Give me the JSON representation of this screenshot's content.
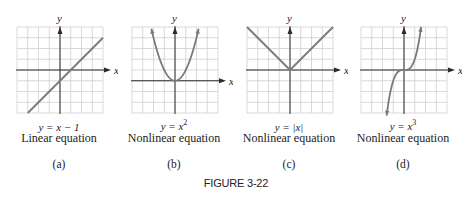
{
  "figure": {
    "caption": "FIGURE 3-22"
  },
  "colors": {
    "grid": "#cfcfcf",
    "axis": "#2a2a2a",
    "curve": "#7a7a7a",
    "text": "#222222"
  },
  "panels": [
    {
      "letter": "(a)",
      "equation_prefix": "y = ",
      "equation_body": "x − 1",
      "equation_sup": "",
      "description": "Linear equation",
      "x_label": "x",
      "y_label": "y"
    },
    {
      "letter": "(b)",
      "equation_prefix": "y = ",
      "equation_body": "x",
      "equation_sup": "2",
      "description": "Nonlinear equation",
      "x_label": "x",
      "y_label": "y"
    },
    {
      "letter": "(c)",
      "equation_prefix": "y = ",
      "equation_body": "|x|",
      "equation_sup": "",
      "description": "Nonlinear equation",
      "x_label": "x",
      "y_label": "y"
    },
    {
      "letter": "(d)",
      "equation_prefix": "y = ",
      "equation_body": "x",
      "equation_sup": "3",
      "description": "Nonlinear equation",
      "x_label": "x",
      "y_label": "y"
    }
  ],
  "chart_data": [
    {
      "type": "line",
      "title": "y = x − 1",
      "subtitle": "Linear equation",
      "label": "(a)",
      "xlabel": "x",
      "ylabel": "y",
      "grid": true,
      "grid_cells": [
        8,
        8
      ],
      "xlim": [
        -4,
        4
      ],
      "ylim": [
        -4,
        4
      ],
      "x": [
        -3,
        -2,
        -1,
        0,
        1,
        2,
        3,
        4
      ],
      "y": [
        -4,
        -3,
        -2,
        -1,
        0,
        1,
        2,
        3
      ]
    },
    {
      "type": "line",
      "title": "y = x^2",
      "subtitle": "Nonlinear equation",
      "label": "(b)",
      "xlabel": "x",
      "ylabel": "y",
      "grid": true,
      "grid_cells": [
        8,
        8
      ],
      "xlim": [
        -4,
        4
      ],
      "ylim": [
        -3,
        5
      ],
      "x": [
        -2.2,
        -2,
        -1.5,
        -1,
        -0.5,
        0,
        0.5,
        1,
        1.5,
        2,
        2.2
      ],
      "y": [
        4.84,
        4,
        2.25,
        1,
        0.25,
        0,
        0.25,
        1,
        2.25,
        4,
        4.84
      ]
    },
    {
      "type": "line",
      "title": "y = |x|",
      "subtitle": "Nonlinear equation",
      "label": "(c)",
      "xlabel": "x",
      "ylabel": "y",
      "grid": true,
      "grid_cells": [
        8,
        8
      ],
      "xlim": [
        -4,
        4
      ],
      "ylim": [
        -4,
        4
      ],
      "x": [
        -4,
        -2,
        0,
        2,
        4
      ],
      "y": [
        4,
        2,
        0,
        2,
        4
      ]
    },
    {
      "type": "line",
      "title": "y = x^3",
      "subtitle": "Nonlinear equation",
      "label": "(d)",
      "xlabel": "x",
      "ylabel": "y",
      "grid": true,
      "grid_cells": [
        8,
        8
      ],
      "xlim": [
        -4,
        4
      ],
      "ylim": [
        -4,
        4
      ],
      "x": [
        -1.6,
        -1.4,
        -1.2,
        -1,
        -0.5,
        0,
        0.5,
        1,
        1.2,
        1.4,
        1.6
      ],
      "y": [
        -4.1,
        -2.74,
        -1.73,
        -1,
        -0.125,
        0,
        0.125,
        1,
        1.73,
        2.74,
        4.1
      ]
    }
  ]
}
